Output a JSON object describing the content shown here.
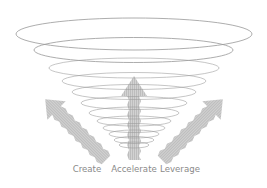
{
  "diagram": {
    "type": "funnel-vortex",
    "ring_count": 12,
    "colors": {
      "ring_stroke": "#9a9a9a",
      "arrow_fill": "#cfcfcf",
      "arrow_stripe": "#b8b8b8",
      "label_text": "#8a8a8a",
      "background": "#ffffff"
    },
    "arrows": [
      {
        "name": "create",
        "direction": "up-left",
        "label": "Create"
      },
      {
        "name": "accelerate",
        "direction": "up",
        "label": "Accelerate"
      },
      {
        "name": "leverage",
        "direction": "up-right",
        "label": "Leverage"
      }
    ]
  },
  "labels": {
    "create": "Create",
    "accelerate": "Accelerate",
    "leverage": "Leverage"
  }
}
